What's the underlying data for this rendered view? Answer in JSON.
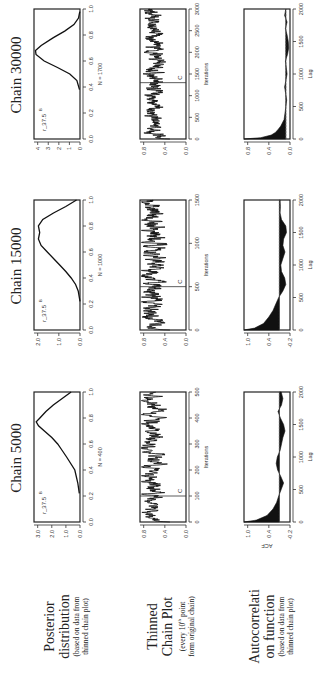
{
  "figure": {
    "rotation_deg": -90,
    "columns": [
      "Chain 5000",
      "Chain 15000",
      "Chain 30000"
    ],
    "rows": [
      {
        "title": "Posterior distribution",
        "sub": "(based on data from thinned chain plot)"
      },
      {
        "title": "Thinned Chain Plot",
        "sub": "(every 10th point form original chain)"
      },
      {
        "title": "Autocorrelation function",
        "sub": "(based on data from thinned chain plot)"
      }
    ],
    "row_titles": {
      "r0a": "Posterior",
      "r0b": "distribution",
      "r0s1": "(based on data from",
      "r0s2": "thinned chain plot)",
      "r1a": "Thinned",
      "r1b": "Chain Plot",
      "r1s1": "(every 10",
      "r1sup": "th",
      "r1s1b": " point",
      "r1s2": "form original chain)",
      "r2a": "Autocorrelati",
      "r2b": "on function",
      "r2s1": "(based on data from",
      "r2s2": "thinned chain plot)"
    },
    "acf_ylabel": "ACF"
  },
  "chart_data": [
    {
      "type": "line",
      "panel": "posterior",
      "column": "Chain 5000",
      "annotation": "r_37.5",
      "annotation_sup": "B",
      "xlabel": "N = 400",
      "xticks": [
        "0.0",
        "0.2",
        "0.4",
        "0.6",
        "0.8",
        "1.0"
      ],
      "yticks": [
        "0.0",
        "1.0",
        "2.0",
        "3.0"
      ],
      "xlim": [
        0,
        1
      ],
      "ylim": [
        0,
        3.1
      ],
      "x": [
        0.22,
        0.3,
        0.4,
        0.5,
        0.55,
        0.6,
        0.65,
        0.7,
        0.74,
        0.77,
        0.8,
        0.85,
        0.9,
        0.95,
        1.0
      ],
      "y": [
        0.05,
        0.15,
        0.35,
        0.9,
        1.2,
        1.5,
        1.9,
        2.4,
        2.8,
        2.95,
        2.7,
        2.3,
        1.8,
        1.2,
        0.6
      ]
    },
    {
      "type": "line",
      "panel": "posterior",
      "column": "Chain 15000",
      "annotation": "r_37.5",
      "annotation_sup": "B",
      "xlabel": "N = 1000",
      "xticks": [
        "0.0",
        "0.2",
        "0.4",
        "0.6",
        "0.8",
        "1.0"
      ],
      "yticks": [
        "0.0",
        "1.0",
        "2.0"
      ],
      "xlim": [
        0,
        1
      ],
      "ylim": [
        0,
        2.6
      ],
      "x": [
        0.22,
        0.3,
        0.35,
        0.4,
        0.45,
        0.5,
        0.55,
        0.6,
        0.65,
        0.7,
        0.75,
        0.8,
        0.85,
        0.9,
        0.95,
        1.0
      ],
      "y": [
        0.0,
        0.1,
        0.25,
        0.5,
        0.8,
        1.15,
        1.5,
        1.85,
        2.2,
        2.35,
        2.28,
        2.35,
        2.1,
        1.5,
        0.8,
        0.2
      ]
    },
    {
      "type": "line",
      "panel": "posterior",
      "column": "Chain 30000",
      "annotation": "r_37.5",
      "annotation_sup": "B",
      "xlabel": "N = 1700",
      "xticks": [
        "0.0",
        "0.2",
        "0.4",
        "0.6",
        "0.8",
        "1.0"
      ],
      "yticks": [
        "0",
        "1",
        "2",
        "3",
        "4"
      ],
      "xlim": [
        0,
        1
      ],
      "ylim": [
        0,
        4.5
      ],
      "x": [
        0.38,
        0.45,
        0.5,
        0.55,
        0.6,
        0.65,
        0.68,
        0.72,
        0.78,
        0.83,
        0.88,
        0.93,
        0.98
      ],
      "y": [
        0.05,
        0.3,
        1.0,
        2.2,
        3.5,
        4.3,
        4.35,
        3.8,
        2.6,
        1.5,
        0.6,
        0.15,
        0.02
      ]
    },
    {
      "type": "line",
      "panel": "trace",
      "column": "Chain 5000",
      "xlabel": "Iterations",
      "xticks": [
        "0",
        "100",
        "200",
        "300",
        "400",
        "500"
      ],
      "yticks": [
        "0.0",
        "0.4",
        "0.8"
      ],
      "xlim": [
        0,
        500
      ],
      "ylim": [
        0,
        1
      ],
      "c_line": 100,
      "c_label": "C",
      "mean_level": 0.72,
      "noise": 0.12,
      "n_points": 500,
      "start_value": 0.05
    },
    {
      "type": "line",
      "panel": "trace",
      "column": "Chain 15000",
      "xlabel": "Iterations",
      "xticks": [
        "0",
        "500",
        "1000",
        "1500"
      ],
      "yticks": [
        "0.0",
        "0.4",
        "0.8"
      ],
      "xlim": [
        0,
        1500
      ],
      "ylim": [
        0,
        1
      ],
      "c_line": 500,
      "c_label": "C",
      "mean_level": 0.72,
      "noise": 0.13,
      "n_points": 1500,
      "start_value": 0.05
    },
    {
      "type": "line",
      "panel": "trace",
      "column": "Chain 30000",
      "xlabel": "Iterations",
      "xticks": [
        "0",
        "500",
        "1000",
        "1500",
        "2000",
        "2500",
        "3000"
      ],
      "yticks": [
        "0.0",
        "0.4",
        "0.8"
      ],
      "xlim": [
        0,
        3000
      ],
      "ylim": [
        0,
        1
      ],
      "c_line": 1300,
      "c_label": "C",
      "mean_level": 0.68,
      "noise": 0.11,
      "n_points": 3000,
      "start_value": 0.1
    },
    {
      "type": "area",
      "panel": "acf",
      "column": "Chain 5000",
      "xlabel": "Lag",
      "ylabel": "ACF",
      "xticks": [
        "0",
        "500",
        "1000",
        "1500",
        "2000"
      ],
      "yticks": [
        "-0.2",
        "0.4",
        "1.0"
      ],
      "xlim": [
        0,
        2000
      ],
      "ylim": [
        -0.3,
        1.0
      ],
      "x": [
        0,
        30,
        100,
        200,
        300,
        400,
        500,
        600,
        700,
        800,
        900,
        1000,
        1100,
        1200,
        1300,
        1400,
        1500,
        1600,
        1700,
        1800,
        1900,
        2000
      ],
      "y": [
        1.0,
        0.65,
        0.35,
        0.18,
        0.08,
        0.02,
        -0.05,
        -0.12,
        -0.04,
        0.05,
        0.09,
        0.06,
        -0.02,
        -0.06,
        -0.1,
        -0.16,
        -0.12,
        -0.03,
        0.04,
        -0.06,
        -0.1,
        -0.05
      ]
    },
    {
      "type": "area",
      "panel": "acf",
      "column": "Chain 15000",
      "xlabel": "Lag",
      "xticks": [
        "0",
        "500",
        "1000",
        "1500",
        "2000"
      ],
      "yticks": [
        "-0.2",
        "0.4",
        "1.0"
      ],
      "xlim": [
        0,
        2000
      ],
      "ylim": [
        -0.3,
        1.0
      ],
      "x": [
        0,
        30,
        100,
        200,
        300,
        400,
        500,
        600,
        700,
        800,
        900,
        1000,
        1100,
        1200,
        1300,
        1400,
        1500,
        1600,
        1700,
        1800,
        1900,
        2000
      ],
      "y": [
        1.0,
        0.7,
        0.45,
        0.3,
        0.18,
        0.1,
        0.02,
        -0.1,
        -0.18,
        -0.15,
        -0.06,
        -0.04,
        -0.1,
        -0.16,
        -0.1,
        -0.12,
        -0.2,
        -0.18,
        -0.06,
        -0.02,
        -0.03,
        -0.02
      ]
    },
    {
      "type": "area",
      "panel": "acf",
      "column": "Chain 30000",
      "xlabel": "Lag",
      "xticks": [
        "0",
        "500",
        "1000",
        "1500",
        "2000"
      ],
      "yticks": [
        "0.0",
        "0.4",
        "0.8"
      ],
      "xlim": [
        0,
        2000
      ],
      "ylim": [
        -0.1,
        1.0
      ],
      "x": [
        0,
        20,
        60,
        100,
        150,
        200,
        300,
        400,
        600,
        800,
        1000,
        1200,
        1300,
        1400,
        1500,
        1600,
        1700,
        1800,
        1900,
        2000
      ],
      "y": [
        1.0,
        0.6,
        0.35,
        0.25,
        0.18,
        0.12,
        0.04,
        0.02,
        -0.02,
        0.03,
        -0.03,
        0.01,
        -0.04,
        -0.07,
        -0.06,
        -0.03,
        0.01,
        -0.03,
        0.03,
        0.0
      ]
    }
  ]
}
